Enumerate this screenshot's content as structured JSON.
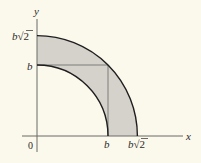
{
  "figure": {
    "colors": {
      "background": "#fbf8ec",
      "region_fill": "#d4d2ca",
      "curve_stroke": "#1e1e1e",
      "axis_stroke": "#6b6b66",
      "square_stroke": "#7d7d78"
    },
    "labels": {
      "y_axis": "y",
      "x_axis": "x",
      "origin": "0",
      "y_b": "b",
      "y_b_sqrt2_b": "b",
      "y_b_sqrt2_root": "√2",
      "x_b": "b",
      "x_b_sqrt2_b": "b",
      "x_b_sqrt2_root": "√2"
    },
    "geometry": {
      "origin_px": [
        37,
        136
      ],
      "inner_radius_px": 71,
      "outer_radius_px": 100.4,
      "inner_radius_label": "b",
      "outer_radius_label": "b√2"
    }
  }
}
